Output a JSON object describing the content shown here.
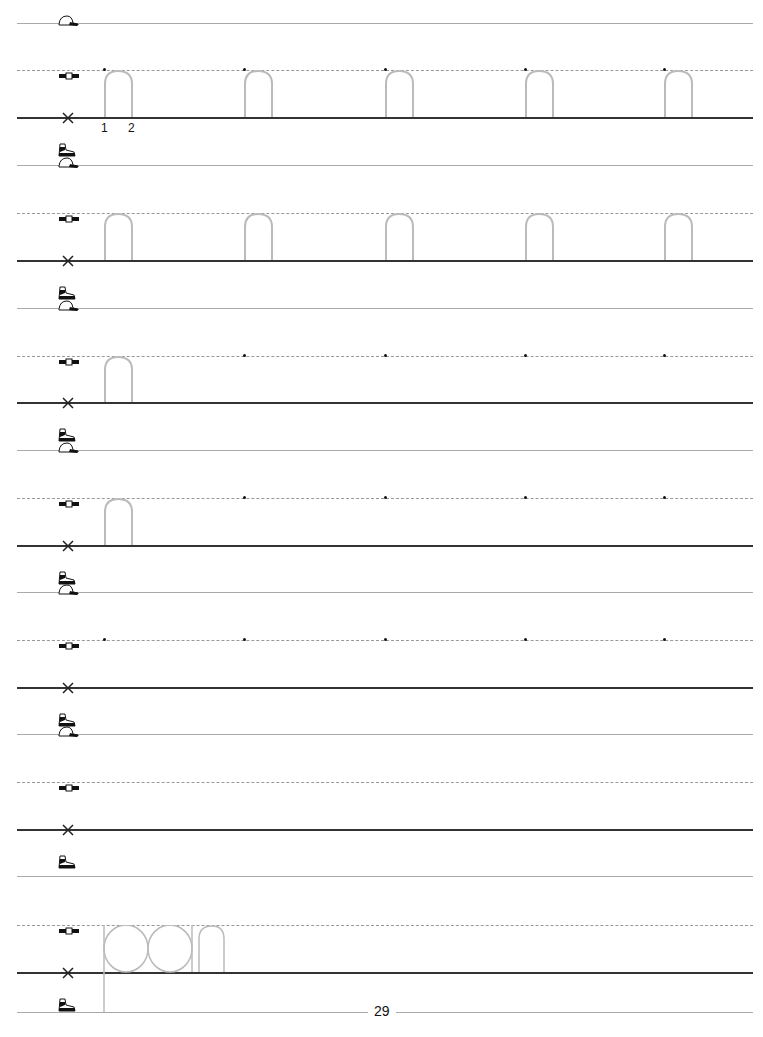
{
  "worksheet": {
    "letter": "n",
    "stroke_numbers": [
      "1",
      "2"
    ],
    "practice_word": "pan",
    "page_number": "29",
    "guide_icons": [
      "cap-icon",
      "belt-icon",
      "x-mark-icon",
      "shoe-icon"
    ],
    "rows": [
      {
        "top": 23,
        "mid": 70,
        "base": 117,
        "traced": [
          true,
          true,
          true,
          true,
          true
        ],
        "dots": [
          true,
          true,
          true,
          true,
          true
        ]
      },
      {
        "top": 165,
        "mid": 213,
        "base": 260,
        "traced": [
          true,
          true,
          true,
          true,
          true
        ],
        "dots": [
          false,
          false,
          false,
          false,
          false
        ]
      },
      {
        "top": 308,
        "mid": 356,
        "base": 402,
        "traced": [
          true,
          false,
          false,
          false,
          false
        ],
        "dots": [
          false,
          true,
          true,
          true,
          true
        ]
      },
      {
        "top": 450,
        "mid": 498,
        "base": 545,
        "traced": [
          true,
          false,
          false,
          false,
          false
        ],
        "dots": [
          false,
          true,
          true,
          true,
          true
        ]
      },
      {
        "top": 592,
        "mid": 640,
        "base": 687,
        "traced": [
          false,
          false,
          false,
          false,
          false
        ],
        "dots": [
          true,
          true,
          true,
          true,
          true
        ]
      },
      {
        "top": 734,
        "mid": 782,
        "base": 829,
        "traced": [
          false,
          false,
          false,
          false,
          false
        ],
        "dots": [
          false,
          false,
          false,
          false,
          false
        ]
      },
      {
        "top": 876,
        "mid": 925,
        "base": 972,
        "traced": [
          false,
          false,
          false,
          false,
          false
        ],
        "dots": [
          false,
          false,
          false,
          false,
          false
        ]
      }
    ],
    "bottom_line": 1012,
    "colors": {
      "trace": "#bbbbbb",
      "baseline": "#333333",
      "guide": "#aaaaaa"
    }
  }
}
